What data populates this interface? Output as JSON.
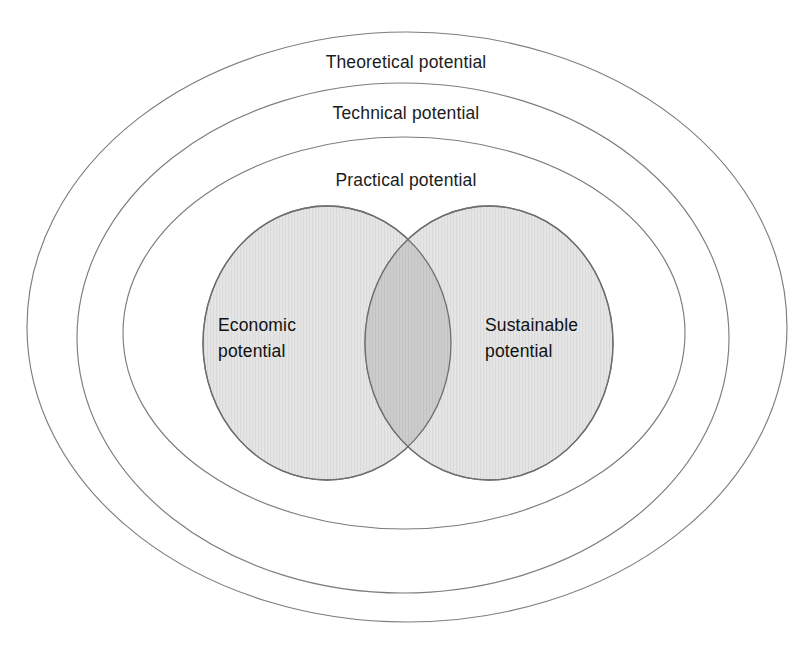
{
  "diagram": {
    "type": "nested-ellipse-venn",
    "canvas": {
      "width": 810,
      "height": 645,
      "background": "#ffffff"
    },
    "rings": [
      {
        "id": "theoretical",
        "label": "Theoretical potential",
        "level": 1,
        "cx": 407,
        "cy": 327,
        "rx": 380,
        "ry": 295,
        "label_x": 406,
        "label_y": 68,
        "stroke": "#7d7d7d",
        "fill": "none"
      },
      {
        "id": "technical",
        "label": "Technical potential",
        "level": 2,
        "cx": 403,
        "cy": 338,
        "rx": 326,
        "ry": 255,
        "label_x": 406,
        "label_y": 119,
        "stroke": "#7d7d7d",
        "fill": "none"
      },
      {
        "id": "practical",
        "label": "Practical potential",
        "level": 3,
        "cx": 404,
        "cy": 333,
        "rx": 281,
        "ry": 196,
        "label_x": 406,
        "label_y": 186,
        "stroke": "#7d7d7d",
        "fill": "none"
      }
    ],
    "venn": {
      "left": {
        "id": "economic",
        "label_line1": "Economic",
        "label_line2": "potential",
        "cx": 327,
        "cy": 343,
        "rx": 124,
        "ry": 137,
        "label_x": 218,
        "label_y1": 331,
        "label_y2": 357,
        "fill": "#e4e4e4",
        "stroke": "#6f6f6f"
      },
      "right": {
        "id": "sustainable",
        "label_line1": "Sustainable",
        "label_line2": "potential",
        "cx": 489,
        "cy": 343,
        "rx": 124,
        "ry": 137,
        "label_x": 485,
        "label_y1": 331,
        "label_y2": 357,
        "fill": "#e4e4e4",
        "stroke": "#6f6f6f"
      },
      "overlap": {
        "id": "economic-sustainable-overlap",
        "fill": "#cbcbcb"
      }
    },
    "colors": {
      "ellipse_fill": "#e4e4e4",
      "overlap_fill": "#cbcbcb",
      "outline": "#7d7d7d",
      "venn_outline": "#6f6f6f",
      "text": "#1c1c1c",
      "background": "#ffffff",
      "texture_stripe": "#d8d8d8"
    }
  }
}
